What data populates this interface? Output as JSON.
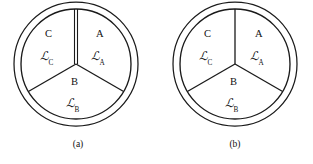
{
  "figure": {
    "background_color": "#ffffff",
    "line_color": "#1a1a1a",
    "width": 313,
    "height": 164,
    "panel_count": 2
  },
  "panels": [
    {
      "id": "a",
      "caption": "(a)",
      "center_x": 76,
      "center_y": 64,
      "outer_radius": 62,
      "inner_radius": 55,
      "divider_style": "double-line-vertical",
      "sectors": [
        {
          "key": "A",
          "name": "sector-a",
          "letter": "A",
          "field_symbol": "ℒ",
          "field_subscript": "A",
          "letter_x": 96,
          "letter_y": 29,
          "field_x": 91,
          "field_y": 50,
          "angle_start_deg": 90,
          "angle_end_deg": 330
        },
        {
          "key": "B",
          "name": "sector-b",
          "letter": "B",
          "field_symbol": "ℒ",
          "field_subscript": "B",
          "letter_x": 71,
          "letter_y": 77,
          "field_x": 66,
          "field_y": 97,
          "angle_start_deg": 330,
          "angle_end_deg": 210
        },
        {
          "key": "C",
          "name": "sector-c",
          "letter": "C",
          "field_symbol": "ℒ",
          "field_subscript": "C",
          "letter_x": 45,
          "letter_y": 29,
          "field_x": 40,
          "field_y": 50,
          "angle_start_deg": 210,
          "angle_end_deg": 90
        }
      ],
      "dividers": [
        {
          "name": "divider-up",
          "angle_deg": 90,
          "double": true
        },
        {
          "name": "divider-lower-left",
          "angle_deg": 210,
          "double": false
        },
        {
          "name": "divider-lower-right",
          "angle_deg": 330,
          "double": false
        }
      ]
    },
    {
      "id": "b",
      "caption": "(b)",
      "center_x": 78,
      "center_y": 64,
      "outer_radius": 62,
      "inner_radius": 55,
      "divider_style": "single-line",
      "sectors": [
        {
          "key": "A",
          "name": "sector-a",
          "letter": "A",
          "field_symbol": "ℒ",
          "field_subscript": "A",
          "letter_x": 98,
          "letter_y": 29,
          "field_x": 93,
          "field_y": 50,
          "angle_start_deg": 90,
          "angle_end_deg": 330
        },
        {
          "key": "B",
          "name": "sector-b",
          "letter": "B",
          "field_symbol": "ℒ",
          "field_subscript": "B",
          "letter_x": 73,
          "letter_y": 77,
          "field_x": 68,
          "field_y": 97,
          "angle_start_deg": 330,
          "angle_end_deg": 210
        },
        {
          "key": "C",
          "name": "sector-c",
          "letter": "C",
          "field_symbol": "ℒ",
          "field_subscript": "C",
          "letter_x": 47,
          "letter_y": 29,
          "field_x": 42,
          "field_y": 50,
          "angle_start_deg": 210,
          "angle_end_deg": 90
        }
      ],
      "dividers": [
        {
          "name": "divider-up",
          "angle_deg": 90,
          "double": false
        },
        {
          "name": "divider-lower-left",
          "angle_deg": 210,
          "double": false
        },
        {
          "name": "divider-lower-right",
          "angle_deg": 330,
          "double": false
        }
      ]
    }
  ]
}
